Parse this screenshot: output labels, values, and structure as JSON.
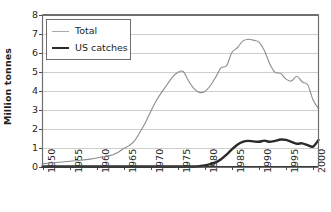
{
  "chart_data": {
    "type": "line",
    "title": "",
    "xlabel": "",
    "ylabel": "Million tonnes",
    "xlim": [
      1950,
      2001
    ],
    "ylim": [
      0,
      8
    ],
    "grid": true,
    "legend_position": "upper-left-inside",
    "y_ticks": [
      0,
      1,
      2,
      3,
      4,
      5,
      6,
      7,
      8
    ],
    "y_tick_labels": [
      "0",
      "1",
      "2",
      "3",
      "4",
      "5",
      "6",
      "7",
      "8"
    ],
    "x_ticks": [
      1950,
      1955,
      1960,
      1965,
      1970,
      1975,
      1980,
      1985,
      1990,
      1995,
      2000
    ],
    "x_tick_labels": [
      "1950",
      "1955",
      "1960",
      "1965",
      "1970",
      "1975",
      "1980",
      "1985",
      "1990",
      "1995",
      "2000"
    ],
    "x": [
      1950,
      1951,
      1952,
      1953,
      1954,
      1955,
      1956,
      1957,
      1958,
      1959,
      1960,
      1961,
      1962,
      1963,
      1964,
      1965,
      1966,
      1967,
      1968,
      1969,
      1970,
      1971,
      1972,
      1973,
      1974,
      1975,
      1976,
      1977,
      1978,
      1979,
      1980,
      1981,
      1982,
      1983,
      1984,
      1985,
      1986,
      1987,
      1988,
      1989,
      1990,
      1991,
      1992,
      1993,
      1994,
      1995,
      1996,
      1997,
      1998,
      1999,
      2000,
      2001
    ],
    "series": [
      {
        "name": "Total",
        "color": "#8c8c8c",
        "line_width": 1.1,
        "values": [
          0.15,
          0.17,
          0.2,
          0.22,
          0.25,
          0.28,
          0.3,
          0.33,
          0.36,
          0.4,
          0.45,
          0.5,
          0.55,
          0.62,
          0.75,
          0.95,
          1.1,
          1.35,
          1.8,
          2.3,
          2.9,
          3.45,
          3.9,
          4.3,
          4.7,
          4.95,
          5.0,
          4.5,
          4.1,
          3.9,
          3.95,
          4.25,
          4.7,
          5.2,
          5.3,
          6.0,
          6.25,
          6.6,
          6.7,
          6.65,
          6.55,
          6.1,
          5.4,
          4.95,
          4.9,
          4.6,
          4.5,
          4.75,
          4.45,
          4.3,
          3.5,
          3.05
        ]
      },
      {
        "name": "US catches",
        "color": "#2b2b2b",
        "line_width": 2.4,
        "values": [
          0,
          0,
          0,
          0,
          0,
          0,
          0,
          0,
          0,
          0,
          0,
          0,
          0,
          0,
          0,
          0,
          0,
          0,
          0,
          0,
          0,
          0,
          0,
          0,
          0,
          0,
          0,
          0,
          0,
          0.02,
          0.05,
          0.12,
          0.22,
          0.38,
          0.62,
          0.9,
          1.15,
          1.3,
          1.35,
          1.32,
          1.3,
          1.36,
          1.3,
          1.35,
          1.42,
          1.4,
          1.3,
          1.2,
          1.22,
          1.12,
          1.05,
          1.4
        ]
      }
    ]
  },
  "legend": {
    "entries": [
      {
        "label": "Total"
      },
      {
        "label": "US catches"
      }
    ]
  },
  "axes": {
    "y_title": "Million tonnes"
  }
}
